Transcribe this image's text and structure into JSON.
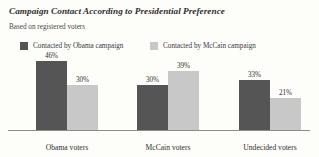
{
  "header": {
    "title": "Campaign Contact According to Presidential Preference",
    "subtitle": "Based on registered voters"
  },
  "colors": {
    "series_obama": "#555555",
    "series_mccain": "#c8c8c8",
    "axis": "#8c8c8c",
    "background": "#fdfdfa",
    "text": "#3a3a3a"
  },
  "chart_data": {
    "type": "bar",
    "title": "Campaign Contact According to Presidential Preference",
    "subtitle": "Based on registered voters",
    "xlabel": "",
    "ylabel": "",
    "ylim": [
      0,
      50
    ],
    "grid": false,
    "legend_position": "top-left",
    "value_suffix": "%",
    "categories": [
      "Obama voters",
      "McCain voters",
      "Undecided voters"
    ],
    "series": [
      {
        "name": "Contacted by Obama campaign",
        "color": "#555555",
        "values": [
          46,
          30,
          33
        ],
        "labels": [
          "46%",
          "30%",
          "33%"
        ]
      },
      {
        "name": "Contacted by McCain campaign",
        "color": "#c8c8c8",
        "values": [
          30,
          39,
          21
        ],
        "labels": [
          "30%",
          "39%",
          "21%"
        ]
      }
    ]
  }
}
